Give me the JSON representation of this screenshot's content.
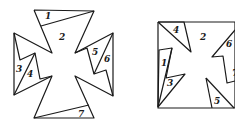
{
  "figures": [
    {
      "name": "cross-figure",
      "description": "Maltese-cross shape dissected into 7 numbered pieces",
      "outline": [
        [
          34,
          10
        ],
        [
          94,
          11
        ],
        [
          75,
          53
        ],
        [
          113,
          33
        ],
        [
          113,
          96
        ],
        [
          75,
          76
        ],
        [
          94,
          118
        ],
        [
          34,
          118
        ],
        [
          52,
          76
        ],
        [
          14,
          95
        ],
        [
          14,
          33
        ],
        [
          52,
          53
        ],
        [
          34,
          10
        ]
      ],
      "cuts": [
        {
          "piece": "1",
          "points": [
            [
              41,
              26
            ],
            [
              94,
              11
            ]
          ]
        },
        {
          "piece": "3-4",
          "points": [
            [
              14,
              33
            ],
            [
              20,
              60
            ],
            [
              35,
              53
            ],
            [
              40,
              79
            ],
            [
              52,
              76
            ]
          ]
        },
        {
          "piece": "3-4-split",
          "points": [
            [
              14,
              95
            ],
            [
              35,
              53
            ]
          ]
        },
        {
          "piece": "5-6",
          "points": [
            [
              75,
              53
            ],
            [
              87,
              48
            ],
            [
              94,
              74
            ],
            [
              106,
              70
            ],
            [
              113,
              96
            ]
          ]
        },
        {
          "piece": "5-6-split",
          "points": [
            [
              113,
              33
            ],
            [
              94,
              74
            ]
          ]
        },
        {
          "piece": "7",
          "points": [
            [
              34,
              118
            ],
            [
              89,
              105
            ]
          ]
        }
      ],
      "labels": [
        {
          "text": "1",
          "x": 45,
          "y": 19
        },
        {
          "text": "2",
          "x": 59,
          "y": 40
        },
        {
          "text": "3",
          "x": 16,
          "y": 72
        },
        {
          "text": "4",
          "x": 27,
          "y": 77
        },
        {
          "text": "5",
          "x": 92,
          "y": 55
        },
        {
          "text": "6",
          "x": 104,
          "y": 62
        },
        {
          "text": "7",
          "x": 78,
          "y": 117
        }
      ]
    },
    {
      "name": "square-figure",
      "description": "Square formed by rearranging the numbered pieces",
      "outline": [
        [
          158,
          22
        ],
        [
          235,
          22
        ],
        [
          235,
          108
        ],
        [
          158,
          108
        ],
        [
          158,
          22
        ]
      ],
      "cuts": [
        {
          "piece": "4",
          "points": [
            [
              158,
              22
            ],
            [
              184,
              22
            ],
            [
              191,
              52
            ],
            [
              158,
              22
            ]
          ]
        },
        {
          "piece": "1-3",
          "points": [
            [
              158,
              107
            ],
            [
              159,
              50
            ],
            [
              172,
              48
            ],
            [
              166,
              78
            ],
            [
              185,
              74
            ],
            [
              158,
              107
            ]
          ]
        },
        {
          "piece": "1-3-split",
          "points": [
            [
              158,
              107
            ],
            [
              172,
              48
            ]
          ]
        },
        {
          "piece": "6",
          "points": [
            [
              235,
              30
            ],
            [
              212,
              57
            ],
            [
              223,
              56
            ],
            [
              227,
              83
            ],
            [
              235,
              81
            ]
          ]
        },
        {
          "piece": "5",
          "points": [
            [
              206,
              78
            ],
            [
              212,
              108
            ]
          ]
        },
        {
          "piece": "5-hyp",
          "points": [
            [
              206,
              78
            ],
            [
              234,
              108
            ]
          ]
        }
      ],
      "labels": [
        {
          "text": "4",
          "x": 173,
          "y": 33
        },
        {
          "text": "2",
          "x": 200,
          "y": 40
        },
        {
          "text": "1",
          "x": 161,
          "y": 66
        },
        {
          "text": "3",
          "x": 167,
          "y": 86
        },
        {
          "text": "6",
          "x": 226,
          "y": 47
        },
        {
          "text": "7",
          "x": 232,
          "y": 76
        },
        {
          "text": "5",
          "x": 214,
          "y": 104
        }
      ]
    }
  ]
}
